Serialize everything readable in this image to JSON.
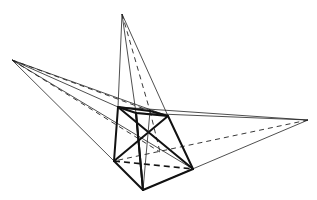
{
  "diagram": {
    "title": "",
    "colors": {
      "line": "#111111",
      "background": "#ffffff"
    },
    "points": {
      "apex_top": [
        122,
        14
      ],
      "apex_left": [
        12,
        60
      ],
      "apex_right": [
        308,
        120
      ],
      "top_back_left": [
        118,
        107
      ],
      "top_back_right": [
        150,
        111
      ],
      "top_front_right": [
        168,
        116
      ],
      "top_front_left": [
        136,
        113
      ],
      "bottom_left": [
        114,
        161
      ],
      "bottom_front": [
        143,
        190
      ],
      "bottom_right": [
        193,
        169
      ],
      "bottom_back": [
        160,
        152
      ],
      "center": [
        150,
        133
      ]
    }
  }
}
